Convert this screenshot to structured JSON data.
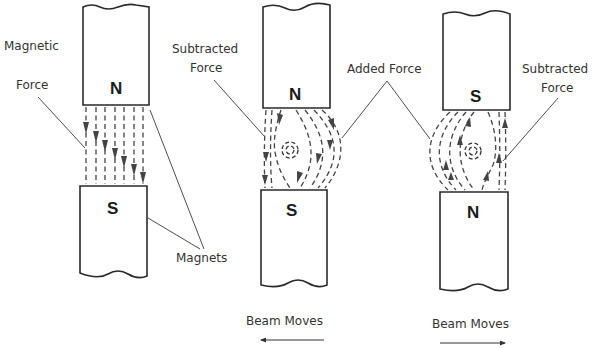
{
  "figure": {
    "panels": [
      {
        "id": "static-field",
        "top_magnet": {
          "pole": "N"
        },
        "bottom_magnet": {
          "pole": "S"
        },
        "labels": {
          "magnetic": "Magnetic",
          "force": "Force",
          "magnets": "Magnets"
        }
      },
      {
        "id": "beam-left",
        "top_magnet": {
          "pole": "N"
        },
        "bottom_magnet": {
          "pole": "S"
        },
        "labels": {
          "subtracted_line1": "Subtracted",
          "subtracted_line2": "Force"
        },
        "caption": "Beam Moves",
        "direction": "left"
      },
      {
        "id": "beam-right",
        "top_magnet": {
          "pole": "S"
        },
        "bottom_magnet": {
          "pole": "N"
        },
        "labels": {
          "subtracted_line1": "Subtracted",
          "subtracted_line2": "Force"
        },
        "caption": "Beam Moves",
        "direction": "right"
      }
    ],
    "shared_labels": {
      "added_force": "Added Force"
    }
  }
}
